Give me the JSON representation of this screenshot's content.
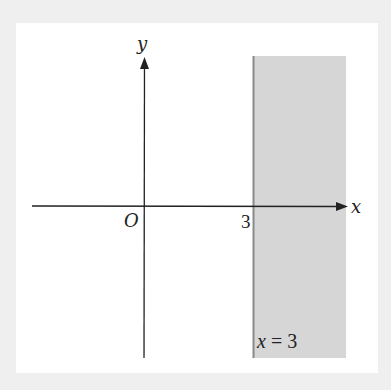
{
  "diagram": {
    "axes": {
      "x_label": "x",
      "y_label": "y",
      "origin_label": "O"
    },
    "tick": {
      "value": "3"
    },
    "boundary": {
      "equation_label": "x = 3",
      "line_x": 3
    },
    "region": {
      "description": "x ≥ 3 shaded",
      "fill": "#d6d6d6",
      "edge": "#8a8a8a"
    },
    "colors": {
      "background": "#efefef",
      "panel": "#ffffff",
      "axis": "#222222"
    }
  }
}
